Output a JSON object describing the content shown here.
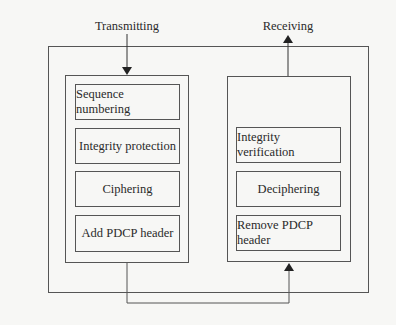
{
  "diagram": {
    "type": "PDCP functional view",
    "labels": {
      "transmitting": "Transmitting",
      "receiving": "Receiving"
    },
    "transmitting_blocks": [
      "Sequence numbering",
      "Integrity protection",
      "Ciphering",
      "Add PDCP header"
    ],
    "receiving_blocks": [
      "Integrity verification",
      "Deciphering",
      "Remove PDCP header"
    ],
    "colors": {
      "line": "#555555",
      "text": "#2a2a2a",
      "background": "#f7f7f5"
    }
  }
}
